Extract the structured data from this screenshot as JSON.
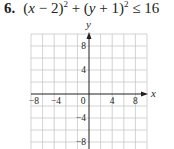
{
  "problem": {
    "number": "6.",
    "inequality_parts": {
      "open1": "(",
      "x": "x",
      "minus2": " − 2)",
      "sq1": "2",
      "plus": " + (",
      "y": "y",
      "plus1": " + 1)",
      "sq2": "2",
      "rel": " ≤ 16"
    }
  },
  "graph": {
    "x_axis_label": "x",
    "y_axis_label": "y",
    "x_ticks": [
      "−8",
      "−4",
      "0",
      "4",
      "8"
    ],
    "y_ticks": [
      "8",
      "4",
      "−4",
      "−8"
    ],
    "grid_color": "#c8c8c8",
    "axis_color": "#231f20"
  }
}
